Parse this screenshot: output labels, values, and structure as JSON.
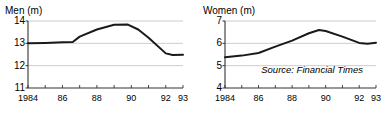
{
  "figure": {
    "source_note": "Source: Financial Times"
  },
  "chart_data": [
    {
      "type": "line",
      "title": "Men (m)",
      "xlabel": "",
      "ylabel": "",
      "ylim": [
        11,
        14
      ],
      "xlim": [
        1984,
        1993
      ],
      "yticks": [
        14,
        13,
        12,
        11
      ],
      "ytick_labels": [
        "14",
        "13",
        "12",
        "11"
      ],
      "xticks": [
        1984,
        1986,
        1988,
        1990,
        1992,
        1993
      ],
      "xtick_labels": [
        "1984",
        "86",
        "88",
        "90",
        "92",
        "93"
      ],
      "minor_xticks": [
        1985,
        1987,
        1989,
        1991
      ],
      "grid": true,
      "grid_axis": "y",
      "legend": "none",
      "line_color": "#1a1a1a",
      "grid_color": "#bfbfbf",
      "x": [
        1984,
        1985,
        1986,
        1986.6,
        1987,
        1988,
        1989,
        1989.8,
        1990.4,
        1991,
        1992,
        1992.4,
        1993
      ],
      "values": [
        13.0,
        13.02,
        13.05,
        13.06,
        13.3,
        13.62,
        13.83,
        13.84,
        13.62,
        13.25,
        12.55,
        12.48,
        12.49
      ]
    },
    {
      "type": "line",
      "title": "Women (m)",
      "xlabel": "",
      "ylabel": "",
      "ylim": [
        4,
        7
      ],
      "xlim": [
        1984,
        1993
      ],
      "yticks": [
        7,
        6,
        5,
        4
      ],
      "ytick_labels": [
        "7",
        "6",
        "5",
        "4"
      ],
      "xticks": [
        1984,
        1986,
        1988,
        1990,
        1992,
        1993
      ],
      "xtick_labels": [
        "1984",
        "86",
        "88",
        "90",
        "92",
        "93"
      ],
      "minor_xticks": [
        1985,
        1987,
        1989,
        1991
      ],
      "grid": true,
      "grid_axis": "y",
      "legend": "none",
      "line_color": "#1a1a1a",
      "grid_color": "#bfbfbf",
      "x": [
        1984,
        1985,
        1986,
        1987,
        1988,
        1989,
        1989.6,
        1990,
        1991,
        1992,
        1992.5,
        1993
      ],
      "values": [
        5.38,
        5.45,
        5.57,
        5.85,
        6.12,
        6.45,
        6.6,
        6.55,
        6.3,
        6.02,
        5.98,
        6.03
      ]
    }
  ]
}
